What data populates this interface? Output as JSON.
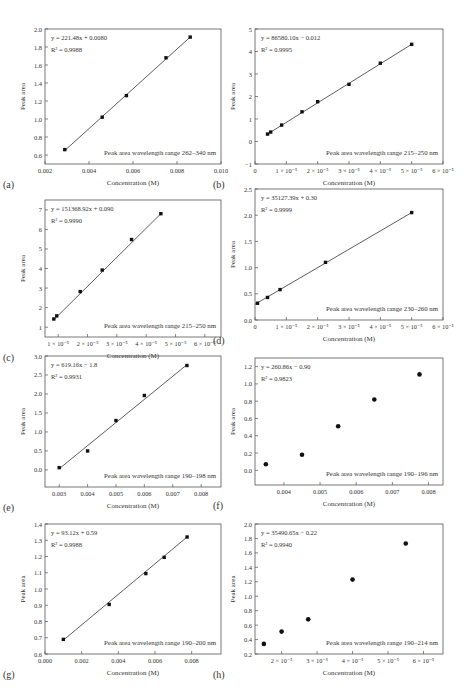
{
  "figure": {
    "panel_count": 8,
    "common_xlabel": "Concentration (M)",
    "common_ylabel": "Peak area"
  },
  "chart_data": [
    {
      "panel": "(a)",
      "type": "scatter",
      "fit": "linear",
      "equation": "y = 221.48x + 0.0080",
      "r2": "R² = 0.9988",
      "annotation": "Peak area wavelength range 262–340 nm",
      "xlabel": "Concentration (M)",
      "ylabel": "Peak area",
      "xlim": [
        0.002,
        0.01
      ],
      "ylim": [
        0.5,
        2.0
      ],
      "xticks": [
        0.002,
        0.004,
        0.006,
        0.008,
        0.01
      ],
      "xtick_labels": [
        "0.002",
        "0.004",
        "0.006",
        "0.008",
        "0.010"
      ],
      "yticks": [
        0.6,
        0.8,
        1.0,
        1.2,
        1.4,
        1.6,
        1.8,
        2.0
      ],
      "ytick_labels": [
        "0.6",
        "0.8",
        "1.0",
        "1.2",
        "1.4",
        "1.6",
        "1.8",
        "2.0"
      ],
      "x": [
        0.0029,
        0.0046,
        0.0057,
        0.0075,
        0.0086
      ],
      "y": [
        0.66,
        1.02,
        1.26,
        1.68,
        1.91
      ],
      "line": [
        [
          0.0029,
          0.65
        ],
        [
          0.0086,
          1.91
        ]
      ]
    },
    {
      "panel": "(b)",
      "type": "scatter",
      "fit": "linear",
      "equation": "y = 86580.10x − 0.012",
      "r2": "R² = 0.9995",
      "annotation": "Peak area wavelength range 215–250 nm",
      "xlabel": "Concentration (M)",
      "ylabel": "Peak area",
      "xlim": [
        0,
        6e-05
      ],
      "ylim": [
        -1,
        5
      ],
      "xticks": [
        0,
        1e-05,
        2e-05,
        3e-05,
        4e-05,
        5e-05,
        6e-05
      ],
      "xtick_labels": [
        "0",
        "1 × 10⁻⁵",
        "2 × 10⁻⁵",
        "3 × 10⁻⁵",
        "4 × 10⁻⁵",
        "5 × 10⁻⁵",
        "6 × 10⁻⁵"
      ],
      "yticks": [
        -1,
        0,
        1,
        2,
        3,
        4,
        5
      ],
      "ytick_labels": [
        "−1",
        "0",
        "1",
        "2",
        "3",
        "4",
        "5"
      ],
      "x": [
        4e-06,
        5e-06,
        8.5e-06,
        1.5e-05,
        2e-05,
        3e-05,
        4e-05,
        5e-05
      ],
      "y": [
        0.33,
        0.42,
        0.73,
        1.32,
        1.77,
        2.54,
        3.48,
        4.32
      ],
      "line": [
        [
          4e-06,
          0.33
        ],
        [
          5e-05,
          4.32
        ]
      ]
    },
    {
      "panel": "(c)",
      "type": "scatter",
      "fit": "linear",
      "equation": "y = 151368.92x + 0.090",
      "r2": "R² = 0.9990",
      "annotation": "Peak area wavelength range 215–250 nm",
      "xlabel": "Concentration (M)",
      "ylabel": "Peak area",
      "xlim": [
        5.5e-06,
        6.55e-05
      ],
      "ylim": [
        0.5,
        7.5
      ],
      "xticks": [
        1e-05,
        2e-05,
        3e-05,
        4e-05,
        5e-05,
        6e-05
      ],
      "xtick_labels": [
        "1 × 10⁻⁵",
        "2 × 10⁻⁵",
        "3 × 10⁻⁵",
        "4 × 10⁻⁵",
        "5 × 10⁻⁵",
        "6 × 10⁻⁵"
      ],
      "yticks": [
        1,
        2,
        3,
        4,
        5,
        6,
        7
      ],
      "ytick_labels": [
        "1",
        "2",
        "3",
        "4",
        "5",
        "6",
        "7"
      ],
      "x": [
        8.5e-06,
        9.5e-06,
        1.75e-05,
        2.5e-05,
        3.5e-05,
        4.5e-05
      ],
      "y": [
        1.42,
        1.58,
        2.82,
        3.92,
        5.48,
        6.8
      ],
      "line": [
        [
          8.5e-06,
          1.38
        ],
        [
          4.5e-05,
          6.8
        ]
      ]
    },
    {
      "panel": "(d)",
      "type": "scatter",
      "fit": "linear",
      "equation": "y = 35127.39x + 0.30",
      "r2": "R² = 0.9999",
      "annotation": "Peak area wavelength range 230–260 nm",
      "xlabel": "Concentration (M)",
      "ylabel": "Peak area",
      "xlim": [
        0,
        6e-05
      ],
      "ylim": [
        0.0,
        2.5
      ],
      "xticks": [
        0,
        1e-05,
        2e-05,
        3e-05,
        4e-05,
        5e-05,
        6e-05
      ],
      "xtick_labels": [
        "0",
        "1 × 10⁻⁵",
        "2 × 10⁻⁵",
        "3 × 10⁻⁵",
        "4 × 10⁻⁵",
        "5 × 10⁻⁵",
        "6 × 10⁻⁵"
      ],
      "yticks": [
        0.0,
        0.5,
        1.0,
        1.5,
        2.0,
        2.5
      ],
      "ytick_labels": [
        "0.0",
        "0.5",
        "1.0",
        "1.5",
        "2.0",
        "2.5"
      ],
      "x": [
        8e-07,
        4e-06,
        8e-06,
        2.25e-05,
        5e-05
      ],
      "y": [
        0.32,
        0.43,
        0.58,
        1.1,
        2.05
      ],
      "line": [
        [
          0.0,
          0.3
        ],
        [
          5e-05,
          2.05
        ]
      ]
    },
    {
      "panel": "(e)",
      "type": "scatter",
      "fit": "linear",
      "equation": "y = 619.16x − 1.8",
      "r2": "R² = 0.9931",
      "annotation": "Peak area wavelength range 190–198 nm",
      "xlabel": "Concentration (M)",
      "ylabel": "Peak area",
      "xlim": [
        0.0025,
        0.0087
      ],
      "ylim": [
        -0.45,
        3.0
      ],
      "xticks": [
        0.003,
        0.004,
        0.005,
        0.006,
        0.007,
        0.008
      ],
      "xtick_labels": [
        "0.003",
        "0.004",
        "0.005",
        "0.006",
        "0.007",
        "0.008"
      ],
      "yticks": [
        0.0,
        0.5,
        1.0,
        1.5,
        2.0,
        2.5,
        3.0
      ],
      "ytick_labels": [
        "0.0",
        "0.5",
        "1.0",
        "1.5",
        "2.0",
        "2.5",
        "3.0"
      ],
      "x": [
        0.003,
        0.004,
        0.005,
        0.006,
        0.0075
      ],
      "y": [
        0.06,
        0.5,
        1.3,
        1.96,
        2.75
      ],
      "line": [
        [
          0.003,
          0.03
        ],
        [
          0.0075,
          2.77
        ]
      ]
    },
    {
      "panel": "(f)",
      "type": "scatter",
      "fit": "none",
      "equation": "y = 260.86x − 0.90",
      "r2": "R² = 0.9823",
      "annotation": "Peak area wavelength range 190–196 nm",
      "xlabel": "Concentration (M)",
      "ylabel": "Peak area",
      "xlim": [
        0.0032,
        0.0084
      ],
      "ylim": [
        -0.17,
        1.3
      ],
      "xticks": [
        0.004,
        0.005,
        0.006,
        0.007,
        0.008
      ],
      "xtick_labels": [
        "0.004",
        "0.005",
        "0.006",
        "0.007",
        "0.008"
      ],
      "yticks": [
        0.0,
        0.2,
        0.4,
        0.6,
        0.8,
        1.0,
        1.2
      ],
      "ytick_labels": [
        "0.0",
        "0.2",
        "0.4",
        "0.6",
        "0.8",
        "1.0",
        "1.2"
      ],
      "x": [
        0.0035,
        0.0045,
        0.0055,
        0.0065,
        0.00775
      ],
      "y": [
        0.07,
        0.18,
        0.51,
        0.82,
        1.11
      ],
      "line": null
    },
    {
      "panel": "(g)",
      "type": "scatter",
      "fit": "linear",
      "equation": "y = 93.12x + 0.59",
      "r2": "R² = 0.9988",
      "annotation": "Peak area wavelength range 190–200 nm",
      "xlabel": "Concentration (M)",
      "ylabel": "Peak area",
      "xlim": [
        0.0,
        0.0096
      ],
      "ylim": [
        0.6,
        1.4
      ],
      "xticks": [
        0.0,
        0.002,
        0.004,
        0.006,
        0.008
      ],
      "xtick_labels": [
        "0.000",
        "0.002",
        "0.004",
        "0.006",
        "0.008"
      ],
      "yticks": [
        0.6,
        0.7,
        0.8,
        0.9,
        1.0,
        1.1,
        1.2,
        1.3,
        1.4
      ],
      "ytick_labels": [
        "0.6",
        "0.7",
        "0.8",
        "0.9",
        "1.0",
        "1.1",
        "1.2",
        "1.3",
        "1.4"
      ],
      "x": [
        0.001,
        0.0035,
        0.0055,
        0.0065,
        0.00775
      ],
      "y": [
        0.69,
        0.905,
        1.095,
        1.195,
        1.32
      ],
      "line": [
        [
          0.001,
          0.685
        ],
        [
          0.00775,
          1.32
        ]
      ]
    },
    {
      "panel": "(h)",
      "type": "scatter",
      "fit": "none",
      "equation": "y = 35490.65x − 0.22",
      "r2": "R² = 0.9940",
      "annotation": "Peak area wavelength range 190–214 nm",
      "xlabel": "Concentration (M)",
      "ylabel": "Peak area",
      "xlim": [
        1.25e-05,
        6.55e-05
      ],
      "ylim": [
        0.2,
        2.0
      ],
      "xticks": [
        2e-05,
        3e-05,
        4e-05,
        5e-05,
        6e-05
      ],
      "xtick_labels": [
        "2 × 10⁻⁵",
        "3 × 10⁻⁵",
        "4 × 10⁻⁵",
        "5 × 10⁻⁵",
        "6 × 10⁻⁵"
      ],
      "yticks": [
        0.2,
        0.4,
        0.6,
        0.8,
        1.0,
        1.2,
        1.4,
        1.6,
        1.8,
        2.0
      ],
      "ytick_labels": [
        "0.2",
        "0.4",
        "0.6",
        "0.8",
        "1.0",
        "1.2",
        "1.4",
        "1.6",
        "1.8",
        "2.0"
      ],
      "x": [
        1.5e-05,
        2e-05,
        2.75e-05,
        4e-05,
        5.5e-05
      ],
      "y": [
        0.34,
        0.51,
        0.68,
        1.23,
        1.73
      ],
      "line": null
    }
  ]
}
